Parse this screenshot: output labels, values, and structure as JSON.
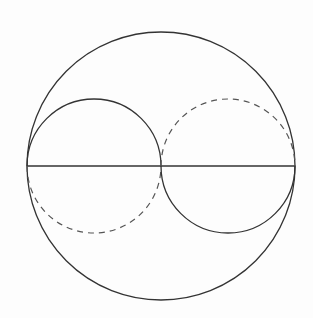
{
  "diagram": {
    "background": "#fdfdfd",
    "stroke": "#333333",
    "outer_circle": {
      "cx": 161,
      "cy": 166,
      "r": 134
    },
    "diameter": {
      "x1": 27,
      "y1": 166,
      "x2": 295,
      "y2": 166
    },
    "left_circle": {
      "cx": 94,
      "cy": 166,
      "r": 67,
      "upper": "solid",
      "lower": "dashed"
    },
    "right_circle": {
      "cx": 228,
      "cy": 166,
      "r": 67,
      "upper": "dashed",
      "lower": "solid"
    }
  }
}
